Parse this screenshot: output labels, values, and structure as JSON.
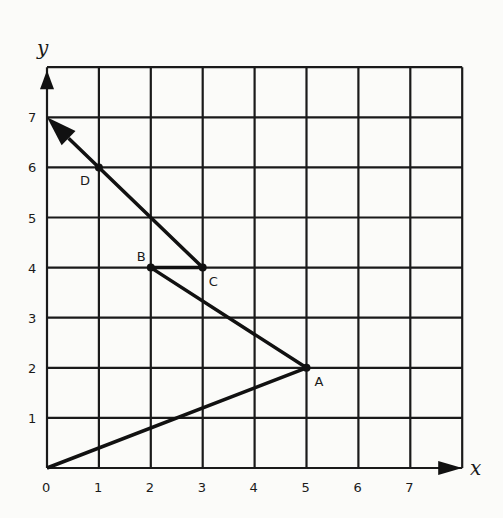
{
  "diagram": {
    "type": "coordinate-grid-path",
    "axes": {
      "x_label": "x",
      "y_label": "y",
      "x_ticks": [
        "0",
        "1",
        "2",
        "3",
        "4",
        "5",
        "6",
        "7"
      ],
      "y_ticks": [
        "1",
        "2",
        "3",
        "4",
        "5",
        "6",
        "7"
      ],
      "range": {
        "x": [
          0,
          8
        ],
        "y": [
          0,
          8
        ]
      }
    },
    "points": [
      {
        "name": "A",
        "x": 5,
        "y": 2
      },
      {
        "name": "B",
        "x": 2,
        "y": 4
      },
      {
        "name": "C",
        "x": 3,
        "y": 4
      },
      {
        "name": "D",
        "x": 1,
        "y": 6
      }
    ],
    "path": [
      [
        0,
        0
      ],
      [
        5,
        2
      ],
      [
        2,
        4
      ],
      [
        3,
        4
      ],
      [
        0,
        7
      ]
    ],
    "path_description": "Origin → A → B → C → through D → arrow ending at (0,7)",
    "colors": {
      "line": "#111111",
      "background": "#fbfbf9"
    }
  }
}
